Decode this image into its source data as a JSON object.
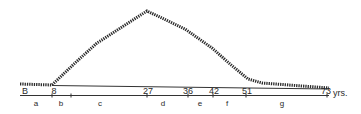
{
  "diagram": {
    "type": "life-span curve",
    "curve_color": "#2b2b2b",
    "axis_color": "#333333",
    "unit_label": "yrs.",
    "curve_points": [
      [
        20,
        84
      ],
      [
        52,
        85
      ],
      [
        75,
        63
      ],
      [
        97,
        43
      ],
      [
        147,
        11
      ],
      [
        185,
        29
      ],
      [
        212,
        48
      ],
      [
        230,
        64
      ],
      [
        248,
        79
      ],
      [
        262,
        83
      ],
      [
        329,
        88
      ]
    ],
    "age_markers": [
      {
        "label": "B",
        "x": 25
      },
      {
        "label": "8",
        "x": 54
      },
      {
        "label": "27",
        "x": 148
      },
      {
        "label": "36",
        "x": 188
      },
      {
        "label": "42",
        "x": 214
      },
      {
        "label": "51",
        "x": 247
      },
      {
        "label": "73",
        "x": 326
      }
    ],
    "ticks": [
      52,
      71,
      147,
      188,
      213,
      246,
      327
    ],
    "segments": [
      {
        "label": "a",
        "x": 36
      },
      {
        "label": "b",
        "x": 61
      },
      {
        "label": "c",
        "x": 100
      },
      {
        "label": "d",
        "x": 163
      },
      {
        "label": "e",
        "x": 200
      },
      {
        "label": "f",
        "x": 227
      },
      {
        "label": "g",
        "x": 282
      }
    ]
  }
}
